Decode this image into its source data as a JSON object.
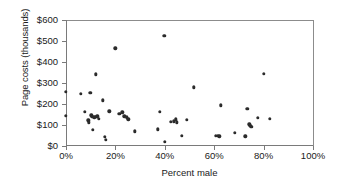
{
  "chart_data": {
    "type": "scatter",
    "title": "",
    "xlabel": "Percent male",
    "ylabel": "Page costs (thousands)",
    "xlim": [
      0,
      100
    ],
    "ylim": [
      0,
      600
    ],
    "grid": false,
    "legend": null,
    "x_tick_labels": [
      "0%",
      "20%",
      "40%",
      "60%",
      "80%",
      "100%"
    ],
    "x_tick_values": [
      0,
      20,
      40,
      60,
      80,
      100
    ],
    "y_tick_labels": [
      "$0",
      "$100",
      "$200",
      "$300",
      "$400",
      "$500",
      "$600"
    ],
    "y_tick_values": [
      0,
      100,
      200,
      300,
      400,
      500,
      600
    ],
    "x_unit": "percent",
    "y_unit": "thousands of dollars",
    "point_count": 53,
    "points": [
      {
        "x": 0.0,
        "y": 257
      },
      {
        "x": 0.0,
        "y": 145
      },
      {
        "x": 6.0,
        "y": 249
      },
      {
        "x": 7.5,
        "y": 163
      },
      {
        "x": 9.0,
        "y": 122
      },
      {
        "x": 9.3,
        "y": 112
      },
      {
        "x": 9.8,
        "y": 252
      },
      {
        "x": 10.2,
        "y": 146
      },
      {
        "x": 10.6,
        "y": 140
      },
      {
        "x": 10.9,
        "y": 78
      },
      {
        "x": 11.4,
        "y": 137
      },
      {
        "x": 12.0,
        "y": 342
      },
      {
        "x": 12.2,
        "y": 139
      },
      {
        "x": 12.6,
        "y": 141
      },
      {
        "x": 13.2,
        "y": 130
      },
      {
        "x": 15.0,
        "y": 218
      },
      {
        "x": 15.6,
        "y": 44
      },
      {
        "x": 16.0,
        "y": 30
      },
      {
        "x": 17.6,
        "y": 165
      },
      {
        "x": 20.0,
        "y": 465
      },
      {
        "x": 21.6,
        "y": 152
      },
      {
        "x": 22.8,
        "y": 161
      },
      {
        "x": 23.6,
        "y": 142
      },
      {
        "x": 24.6,
        "y": 137
      },
      {
        "x": 25.2,
        "y": 127
      },
      {
        "x": 27.8,
        "y": 70
      },
      {
        "x": 37.2,
        "y": 80
      },
      {
        "x": 38.0,
        "y": 163
      },
      {
        "x": 39.8,
        "y": 525
      },
      {
        "x": 40.0,
        "y": 21
      },
      {
        "x": 42.4,
        "y": 114
      },
      {
        "x": 43.6,
        "y": 117
      },
      {
        "x": 44.4,
        "y": 127
      },
      {
        "x": 44.8,
        "y": 112
      },
      {
        "x": 46.8,
        "y": 48
      },
      {
        "x": 48.8,
        "y": 125
      },
      {
        "x": 51.8,
        "y": 280
      },
      {
        "x": 60.6,
        "y": 48
      },
      {
        "x": 61.4,
        "y": 50
      },
      {
        "x": 62.0,
        "y": 47
      },
      {
        "x": 62.6,
        "y": 193
      },
      {
        "x": 68.4,
        "y": 62
      },
      {
        "x": 72.6,
        "y": 46
      },
      {
        "x": 73.4,
        "y": 177
      },
      {
        "x": 74.2,
        "y": 103
      },
      {
        "x": 74.6,
        "y": 96
      },
      {
        "x": 75.0,
        "y": 91
      },
      {
        "x": 77.6,
        "y": 134
      },
      {
        "x": 80.0,
        "y": 343
      },
      {
        "x": 82.4,
        "y": 130
      }
    ]
  },
  "axes": {
    "x_title": "Percent male",
    "y_title": "Page costs (thousands)"
  },
  "colors": {
    "marker": "#2b2b2b",
    "axis": "#7a7a7a",
    "background": "#ffffff",
    "text": "#1a1a1a"
  }
}
